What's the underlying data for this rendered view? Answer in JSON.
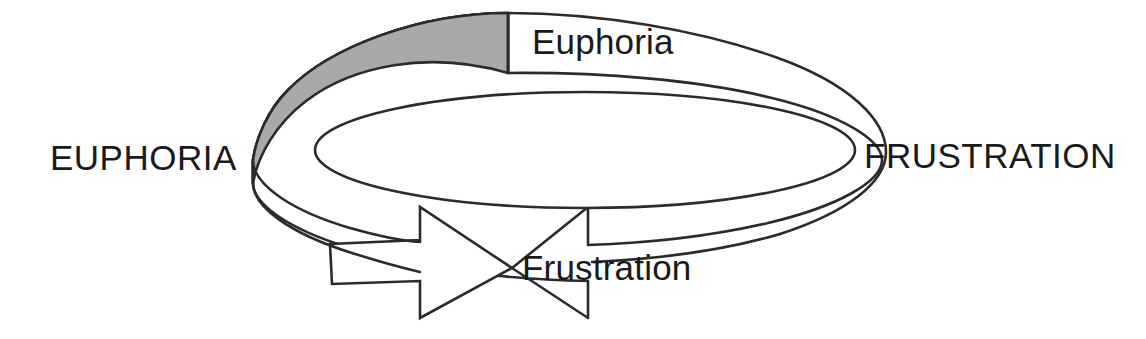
{
  "diagram": {
    "type": "circular-arrow-cycle",
    "labels": {
      "left_caps": "EUPHORIA",
      "right_caps": "FRUSTRATION",
      "top_mixed": "Euphoria",
      "bottom_mixed": "Frustration"
    },
    "shapes": {
      "band_fill": "#a9a9a9",
      "band_stroke": "#2b2b2b",
      "ring_fill": "#ffffff",
      "ring_stroke": "#2b2b2b",
      "arrow_fill": "#ffffff",
      "arrow_stroke": "#2b2b2b",
      "background": "#ffffff"
    },
    "icon_names": {
      "ring": "circular-ring-shape",
      "shaded_band": "shaded-band-segment",
      "arrow": "right-pointing-arrow-head"
    }
  }
}
